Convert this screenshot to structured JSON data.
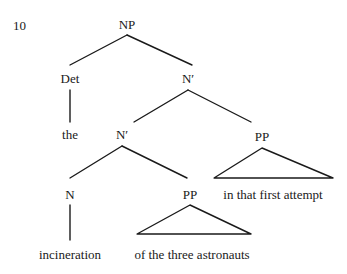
{
  "figure": {
    "example_number": "10",
    "background_color": "#ffffff",
    "line_color": "#1a1a1a",
    "text_color": "#1a1a1a"
  },
  "tree": {
    "nodes": [
      {
        "id": "np",
        "label": "NP",
        "x": 127,
        "y": 18
      },
      {
        "id": "det",
        "label": "Det",
        "x": 70,
        "y": 72
      },
      {
        "id": "n-bar-1",
        "label": "N′",
        "x": 188,
        "y": 72
      },
      {
        "id": "n-bar-2",
        "label": "N′",
        "x": 122,
        "y": 128
      },
      {
        "id": "pp-2",
        "label": "PP",
        "x": 262,
        "y": 130
      },
      {
        "id": "n",
        "label": "N",
        "x": 70,
        "y": 188
      },
      {
        "id": "pp-1",
        "label": "PP",
        "x": 190,
        "y": 188
      }
    ],
    "leaves": [
      {
        "id": "leaf-the",
        "label": "the",
        "x": 70,
        "y": 128
      },
      {
        "id": "leaf-in-attempt",
        "label": "in that first attempt",
        "x": 273,
        "y": 188
      },
      {
        "id": "leaf-incineration",
        "label": "incineration",
        "x": 70,
        "y": 248
      },
      {
        "id": "leaf-of-three",
        "label": "of the three astronauts",
        "x": 192,
        "y": 248
      }
    ],
    "edges": [
      {
        "id": "edge-np-det",
        "x1": 127,
        "y1": 35,
        "x2": 70,
        "y2": 65
      },
      {
        "id": "edge-np-nbar1",
        "x1": 127,
        "y1": 35,
        "x2": 192,
        "y2": 65
      },
      {
        "id": "edge-det-the",
        "x1": 70,
        "y1": 90,
        "x2": 70,
        "y2": 122
      },
      {
        "id": "edge-nbar1-nbar2",
        "x1": 188,
        "y1": 90,
        "x2": 134,
        "y2": 122
      },
      {
        "id": "edge-nbar1-pp2",
        "x1": 188,
        "y1": 90,
        "x2": 251,
        "y2": 122
      },
      {
        "id": "edge-nbar2-n",
        "x1": 122,
        "y1": 146,
        "x2": 70,
        "y2": 178
      },
      {
        "id": "edge-nbar2-pp1",
        "x1": 122,
        "y1": 146,
        "x2": 187,
        "y2": 178
      },
      {
        "id": "edge-n-incin",
        "x1": 70,
        "y1": 205,
        "x2": 70,
        "y2": 240
      }
    ],
    "triangles": [
      {
        "id": "triangle-pp-in-that-first-attempt",
        "apex_x": 262,
        "apex_y": 148,
        "left_x": 214,
        "left_y": 178,
        "right_x": 333,
        "right_y": 178
      },
      {
        "id": "triangle-pp-of-the-three-astronauts",
        "apex_x": 190,
        "apex_y": 205,
        "left_x": 137,
        "left_y": 234,
        "right_x": 251,
        "right_y": 234
      }
    ]
  }
}
